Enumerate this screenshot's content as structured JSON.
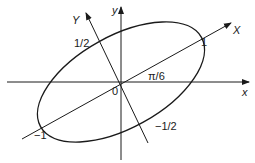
{
  "diagram": {
    "axes": {
      "x_label": "x",
      "y_label": "y",
      "X_label": "X",
      "Y_label": "Y",
      "origin_label": "0"
    },
    "angle_label": "π/6",
    "intercepts": {
      "X_positive": "1",
      "X_negative": "−1",
      "Y_positive": "1/2",
      "Y_negative": "−1/2"
    },
    "ellipse": {
      "semi_major": 1,
      "semi_minor": 0.5,
      "rotation": "π/6"
    },
    "colors": {
      "stroke": "#1a1a1a",
      "background": "#ffffff"
    }
  }
}
